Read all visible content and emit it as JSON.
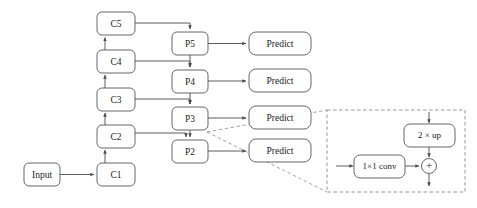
{
  "diagram": {
    "colors": {
      "background": "#ffffff",
      "box_stroke": "#555555",
      "box_fill": "#ffffff",
      "edge": "#4a4a4a",
      "dashed": "#8a8a8a",
      "text": "#1a1a1a"
    },
    "input": {
      "label": "Input"
    },
    "backbone": {
      "name": "c-column",
      "nodes": [
        {
          "id": "C5",
          "label": "C5"
        },
        {
          "id": "C4",
          "label": "C4"
        },
        {
          "id": "C3",
          "label": "C3"
        },
        {
          "id": "C2",
          "label": "C2"
        },
        {
          "id": "C1",
          "label": "C1"
        }
      ]
    },
    "pyramid": {
      "name": "p-column",
      "nodes": [
        {
          "id": "P5",
          "label": "P5"
        },
        {
          "id": "P4",
          "label": "P4"
        },
        {
          "id": "P3",
          "label": "P3"
        },
        {
          "id": "P2",
          "label": "P2"
        }
      ]
    },
    "heads": {
      "name": "predict-column",
      "nodes": [
        {
          "id": "predict5",
          "label": "Predict"
        },
        {
          "id": "predict4",
          "label": "Predict"
        },
        {
          "id": "predict3",
          "label": "Predict"
        },
        {
          "id": "predict2",
          "label": "Predict"
        }
      ]
    },
    "inset": {
      "name": "merge-detail",
      "upsample_label": "2 × up",
      "conv_label": "1×1 conv",
      "add_label": "+"
    }
  }
}
